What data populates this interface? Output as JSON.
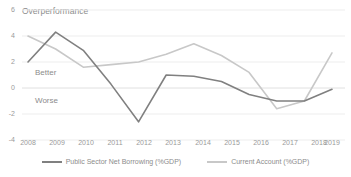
{
  "chart_data": {
    "type": "line",
    "title": "Overperformance",
    "xlabel": "",
    "ylabel": "",
    "categories": [
      "2008",
      "2009",
      "2010",
      "2011",
      "2012",
      "2013",
      "2014",
      "2015",
      "2016",
      "2017",
      "2018",
      "2019"
    ],
    "series": [
      {
        "name": "Public Sector Net Borrowing (%GDP)",
        "color": "#808080",
        "values": [
          2.0,
          4.3,
          2.9,
          0.3,
          -2.6,
          1.0,
          0.9,
          0.5,
          -0.5,
          -1.0,
          -1.0,
          -0.1
        ]
      },
      {
        "name": "Current Account (%GDP)",
        "color": "#c8c8c8",
        "values": [
          4.0,
          3.0,
          1.6,
          1.8,
          2.0,
          2.6,
          3.4,
          2.5,
          1.2,
          -1.6,
          -1.0,
          2.7
        ]
      }
    ],
    "ylim": [
      -4,
      6
    ],
    "yticks": [
      6,
      4,
      2,
      0,
      -2,
      -4
    ],
    "ytick_labels": [
      "6",
      "4",
      "2",
      "0",
      "-2",
      "-4"
    ],
    "grid": true,
    "gridline_color": "#e6e6e6",
    "legend_position": "bottom",
    "annotations": [
      {
        "text": "Better",
        "region": "above-zero"
      },
      {
        "text": "Worse",
        "region": "below-zero"
      }
    ]
  },
  "axis": {
    "y_labels": [
      "6",
      "4",
      "2",
      "0",
      "-2",
      "-4"
    ],
    "x_labels": [
      "2008",
      "2009",
      "2010",
      "2011",
      "2012",
      "2013",
      "2014",
      "2015",
      "2016",
      "2017",
      "2018",
      "2019"
    ]
  },
  "annotations": {
    "better": "Better",
    "worse": "Worse"
  },
  "legend": {
    "items": [
      {
        "label": "Public Sector Net Borrowing (%GDP)"
      },
      {
        "label": "Current Account (%GDP)"
      }
    ]
  }
}
